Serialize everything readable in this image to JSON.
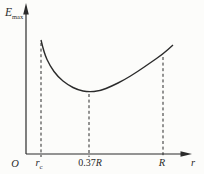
{
  "figure": {
    "background": "#fcfcfa",
    "line_color": "#2b2b2b",
    "text_color": "#2b2b2b"
  },
  "labels": {
    "y_axis": {
      "main": "E",
      "sub": "max"
    },
    "x_axis": "r",
    "origin": "O",
    "tick_rc": {
      "main": "r",
      "sub": "c"
    },
    "tick_037R": {
      "prefix": "0.37",
      "symbol": "R"
    },
    "tick_R": "R"
  },
  "chart_data": {
    "type": "line",
    "title": "",
    "xlabel": "r",
    "ylabel": "E_max",
    "x_ticks": [
      "O",
      "r_c",
      "0.37R",
      "R"
    ],
    "minimum_at": "0.37R",
    "shape": "curve starts high at r_c, decreases to a minimum at r = 0.37R, then rises through R"
  },
  "geometry": {
    "width": 204,
    "height": 174,
    "axis": {
      "origin_x": 26,
      "origin_y": 154,
      "y_top": 3,
      "x_right": 192
    },
    "tick_drop": 157,
    "dash_pattern": "3 2.6",
    "curve_points": [
      [
        41,
        40
      ],
      [
        44,
        53
      ],
      [
        50,
        66
      ],
      [
        58,
        77
      ],
      [
        68,
        85
      ],
      [
        78,
        90
      ],
      [
        88,
        92
      ],
      [
        100,
        91
      ],
      [
        112,
        86
      ],
      [
        124,
        80
      ],
      [
        137,
        72
      ],
      [
        150,
        63
      ],
      [
        163,
        54
      ],
      [
        173,
        45
      ]
    ],
    "dashed_guides": [
      {
        "x": 41,
        "y_top": 43
      },
      {
        "x": 89,
        "y_top": 94
      },
      {
        "x": 163,
        "y_top": 57
      }
    ]
  }
}
